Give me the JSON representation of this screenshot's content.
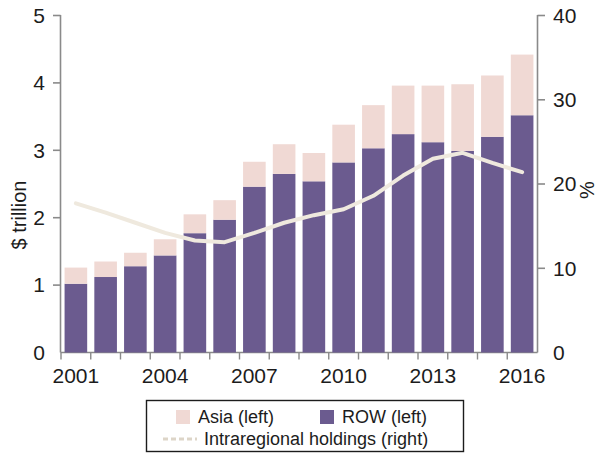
{
  "chart_data": {
    "type": "bar",
    "title": "",
    "subtitle": "",
    "xlabel": "",
    "ylabel": "$ trillion",
    "y2label": "%",
    "categories": [
      "2001",
      "2002",
      "2003",
      "2004",
      "2005",
      "2006",
      "2007",
      "2008",
      "2009",
      "2010",
      "2011",
      "2012",
      "2013",
      "2014",
      "2015",
      "2016"
    ],
    "xtick_labels": [
      "2001",
      "2004",
      "2007",
      "2010",
      "2013",
      "2016"
    ],
    "ytick_labels": [
      "0",
      "1",
      "2",
      "3",
      "4",
      "5"
    ],
    "y2tick_labels": [
      "0",
      "10",
      "20",
      "30",
      "40"
    ],
    "ylim": [
      0,
      5
    ],
    "y2lim": [
      0,
      40
    ],
    "grid": false,
    "stacked": true,
    "legend_position": "bottom",
    "series": [
      {
        "name": "ROW (left)",
        "key": "row",
        "axis": "left",
        "type": "bar",
        "color": "#6b5b8f",
        "values": [
          1.02,
          1.12,
          1.28,
          1.44,
          1.77,
          1.97,
          2.46,
          2.65,
          2.54,
          2.82,
          3.03,
          3.24,
          3.12,
          2.99,
          3.2,
          3.52
        ]
      },
      {
        "name": "Asia (left)",
        "key": "asia",
        "axis": "left",
        "type": "bar",
        "color": "#f0d9d4",
        "values": [
          0.24,
          0.23,
          0.2,
          0.24,
          0.28,
          0.29,
          0.37,
          0.44,
          0.42,
          0.56,
          0.64,
          0.72,
          0.84,
          0.99,
          0.91,
          0.9
        ]
      },
      {
        "name": "Intraregional holdings (right)",
        "key": "intraregional",
        "axis": "right",
        "type": "line",
        "color": "#ece5da",
        "values": [
          17.7,
          16.6,
          15.4,
          14.2,
          13.3,
          13.1,
          14.2,
          15.4,
          16.3,
          17.0,
          18.6,
          21.0,
          23.0,
          23.7,
          22.5,
          21.4
        ]
      }
    ],
    "totals": [
      1.26,
      1.35,
      1.48,
      1.68,
      2.05,
      2.26,
      2.83,
      3.09,
      2.96,
      3.38,
      3.67,
      3.96,
      3.96,
      3.98,
      4.11,
      4.42
    ]
  },
  "legend": {
    "entries": [
      {
        "label": "Asia (left)",
        "swatch": "asia-swatch",
        "color": "#f0d9d4"
      },
      {
        "label": "ROW (left)",
        "swatch": "row-swatch",
        "color": "#6b5b8f"
      },
      {
        "label": "Intraregional holdings (right)",
        "swatch": "line-swatch",
        "color": "#ece5da"
      }
    ]
  },
  "axes": {
    "left_title": "$ trillion",
    "right_title": "%"
  }
}
